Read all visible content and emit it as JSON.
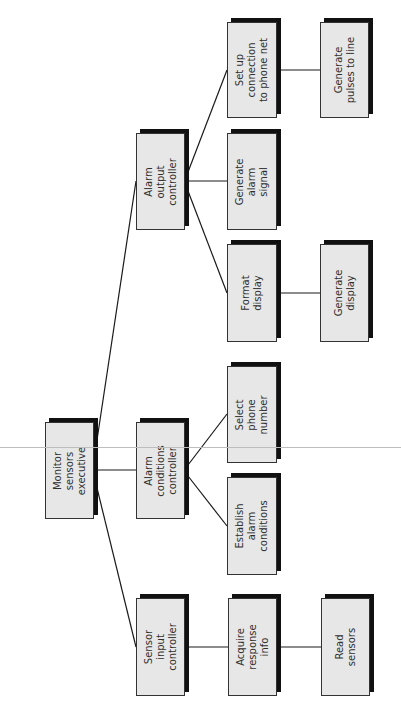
{
  "diagram": {
    "type": "structure-chart",
    "orientation": "rotated-90-ccw",
    "colors": {
      "box_fill": "#e7e7e7",
      "box_border": "#333333",
      "box_shadow": "#111111",
      "connector": "#1a1a1a",
      "text": "#2f2f2f",
      "fold_line": "#bdbdbd"
    },
    "nodes": [
      {
        "id": "monitor",
        "label": "Monitor\nsensors\nexecutive",
        "x": 45,
        "y": 422,
        "w": 49,
        "h": 97
      },
      {
        "id": "alarm_output",
        "label": "Alarm\noutput\ncontroller",
        "x": 136,
        "y": 133,
        "w": 49,
        "h": 97
      },
      {
        "id": "alarm_conditions",
        "label": "Alarm\nconditions\ncontroller",
        "x": 136,
        "y": 422,
        "w": 49,
        "h": 97
      },
      {
        "id": "sensor_input",
        "label": "Sensor\ninput\ncontroller",
        "x": 136,
        "y": 598,
        "w": 49,
        "h": 98
      },
      {
        "id": "setup_connection",
        "label": "Set up\nconnection\nto phone net",
        "x": 227,
        "y": 22,
        "w": 50,
        "h": 96
      },
      {
        "id": "gen_alarm_signal",
        "label": "Generate\nalarm\nsignal",
        "x": 227,
        "y": 133,
        "w": 50,
        "h": 97
      },
      {
        "id": "format_display",
        "label": "Format\ndisplay",
        "x": 227,
        "y": 244,
        "w": 50,
        "h": 98
      },
      {
        "id": "select_phone",
        "label": "Select\nphone\nnumber",
        "x": 227,
        "y": 366,
        "w": 50,
        "h": 97
      },
      {
        "id": "establish_alarm",
        "label": "Establish\nalarm\nconditions",
        "x": 227,
        "y": 477,
        "w": 50,
        "h": 98
      },
      {
        "id": "acquire_response",
        "label": "Acquire\nresponse\ninfo",
        "x": 228,
        "y": 598,
        "w": 49,
        "h": 98
      },
      {
        "id": "gen_pulses",
        "label": "Generate\npulses to line",
        "x": 320,
        "y": 22,
        "w": 49,
        "h": 96
      },
      {
        "id": "gen_display",
        "label": "Generate\ndisplay",
        "x": 320,
        "y": 244,
        "w": 49,
        "h": 98
      },
      {
        "id": "read_sensors",
        "label": "Read\nsensors",
        "x": 321,
        "y": 598,
        "w": 49,
        "h": 98
      }
    ],
    "edges": [
      {
        "from": "monitor",
        "to": "alarm_output",
        "x1": 97,
        "y1": 440,
        "x2": 136,
        "y2": 181
      },
      {
        "from": "monitor",
        "to": "alarm_conditions",
        "x1": 98,
        "y1": 470,
        "x2": 136,
        "y2": 470
      },
      {
        "from": "monitor",
        "to": "sensor_input",
        "x1": 97,
        "y1": 488,
        "x2": 136,
        "y2": 647
      },
      {
        "from": "alarm_output",
        "to": "setup_connection",
        "x1": 188,
        "y1": 172,
        "x2": 227,
        "y2": 70
      },
      {
        "from": "alarm_output",
        "to": "gen_alarm_signal",
        "x1": 188,
        "y1": 181,
        "x2": 227,
        "y2": 181
      },
      {
        "from": "alarm_output",
        "to": "format_display",
        "x1": 188,
        "y1": 191,
        "x2": 227,
        "y2": 293
      },
      {
        "from": "alarm_conditions",
        "to": "select_phone",
        "x1": 188,
        "y1": 465,
        "x2": 227,
        "y2": 414
      },
      {
        "from": "alarm_conditions",
        "to": "establish_alarm",
        "x1": 188,
        "y1": 476,
        "x2": 227,
        "y2": 526
      },
      {
        "from": "sensor_input",
        "to": "acquire_response",
        "x1": 188,
        "y1": 647,
        "x2": 228,
        "y2": 647
      },
      {
        "from": "acquire_response",
        "to": "read_sensors",
        "x1": 280,
        "y1": 647,
        "x2": 321,
        "y2": 647
      },
      {
        "from": "setup_connection",
        "to": "gen_pulses",
        "x1": 280,
        "y1": 70,
        "x2": 320,
        "y2": 70
      },
      {
        "from": "format_display",
        "to": "gen_display",
        "x1": 280,
        "y1": 293,
        "x2": 320,
        "y2": 293
      }
    ],
    "fold_line_y": 447
  }
}
